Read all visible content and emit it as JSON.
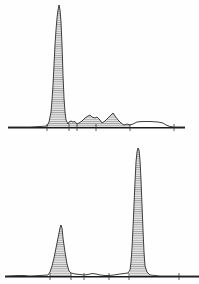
{
  "figure": {
    "colors": {
      "line": "#2a2a2a",
      "hatch": "#555555",
      "fill": "#e6e6e6",
      "baseline": "#1a1a1a"
    }
  },
  "chart_data": [
    {
      "type": "area",
      "title": "",
      "xlabel": "",
      "ylabel": "",
      "grid": false,
      "legend": null,
      "panel": "top",
      "baseline_y": 127,
      "x_range": [
        8,
        185
      ],
      "ticks_x": [
        47,
        69,
        77,
        96,
        130,
        174
      ],
      "points": [
        [
          8,
          127
        ],
        [
          30,
          127
        ],
        [
          40,
          126.5
        ],
        [
          47,
          126
        ],
        [
          49,
          122
        ],
        [
          51,
          112
        ],
        [
          52,
          100
        ],
        [
          53,
          85
        ],
        [
          54,
          65
        ],
        [
          55,
          45
        ],
        [
          56,
          30
        ],
        [
          57,
          18
        ],
        [
          58,
          10
        ],
        [
          59,
          5
        ],
        [
          60,
          10
        ],
        [
          61,
          22
        ],
        [
          62,
          45
        ],
        [
          63,
          75
        ],
        [
          64,
          98
        ],
        [
          65,
          112
        ],
        [
          66,
          120
        ],
        [
          68,
          124
        ],
        [
          69,
          122
        ],
        [
          71,
          121
        ],
        [
          73,
          122
        ],
        [
          75,
          121.5
        ],
        [
          77,
          124
        ],
        [
          79,
          123
        ],
        [
          82,
          121
        ],
        [
          85,
          118
        ],
        [
          88,
          116
        ],
        [
          90,
          115
        ],
        [
          92,
          117
        ],
        [
          95,
          118
        ],
        [
          97,
          117
        ],
        [
          100,
          120
        ],
        [
          102,
          123
        ],
        [
          105,
          121
        ],
        [
          108,
          118
        ],
        [
          111,
          115
        ],
        [
          113,
          113
        ],
        [
          115,
          116
        ],
        [
          118,
          120
        ],
        [
          121,
          123
        ],
        [
          124,
          125
        ],
        [
          127,
          124
        ],
        [
          130,
          125
        ],
        [
          133,
          124
        ],
        [
          137,
          122
        ],
        [
          142,
          121.5
        ],
        [
          150,
          121.5
        ],
        [
          158,
          122
        ],
        [
          163,
          123
        ],
        [
          166,
          125
        ],
        [
          170,
          126.5
        ],
        [
          174,
          127
        ],
        [
          185,
          127
        ]
      ],
      "shaded_ranges": [
        [
          47,
          69
        ],
        [
          69,
          130
        ]
      ]
    },
    {
      "type": "area",
      "title": "",
      "xlabel": "",
      "ylabel": "",
      "grid": false,
      "legend": null,
      "panel": "bottom",
      "baseline_y": 276,
      "x_range": [
        5,
        199
      ],
      "ticks_x": [
        50,
        71,
        84,
        109,
        129,
        179
      ],
      "points": [
        [
          5,
          276
        ],
        [
          18,
          275.5
        ],
        [
          24,
          275.5
        ],
        [
          30,
          276
        ],
        [
          40,
          275.5
        ],
        [
          48,
          275
        ],
        [
          50,
          272
        ],
        [
          52,
          266
        ],
        [
          54,
          258
        ],
        [
          56,
          248
        ],
        [
          58,
          238
        ],
        [
          60,
          228
        ],
        [
          61,
          225
        ],
        [
          62,
          228
        ],
        [
          63,
          238
        ],
        [
          65,
          252
        ],
        [
          67,
          264
        ],
        [
          69,
          271
        ],
        [
          71,
          273
        ],
        [
          75,
          274
        ],
        [
          80,
          274.5
        ],
        [
          84,
          275
        ],
        [
          88,
          274.5
        ],
        [
          92,
          273.5
        ],
        [
          96,
          274
        ],
        [
          100,
          275
        ],
        [
          105,
          275.5
        ],
        [
          109,
          275.5
        ],
        [
          114,
          275
        ],
        [
          120,
          274
        ],
        [
          124,
          273.5
        ],
        [
          128,
          273
        ],
        [
          130,
          270
        ],
        [
          131,
          262
        ],
        [
          132,
          248
        ],
        [
          133,
          228
        ],
        [
          134,
          205
        ],
        [
          135,
          182
        ],
        [
          136,
          162
        ],
        [
          137,
          152
        ],
        [
          138,
          148
        ],
        [
          139,
          150
        ],
        [
          140,
          160
        ],
        [
          141,
          180
        ],
        [
          142,
          205
        ],
        [
          143,
          230
        ],
        [
          144,
          252
        ],
        [
          145,
          266
        ],
        [
          147,
          272
        ],
        [
          150,
          275
        ],
        [
          160,
          276
        ],
        [
          179,
          276
        ],
        [
          199,
          276
        ]
      ],
      "shaded_ranges": [
        [
          50,
          71
        ],
        [
          129,
          150
        ]
      ]
    }
  ]
}
